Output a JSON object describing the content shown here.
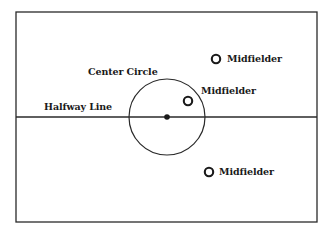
{
  "diagram": {
    "colors": {
      "line": "#2a2a2a",
      "background": "#ffffff",
      "text": "#1a1a1a"
    },
    "field": {
      "x": 16,
      "y": 12,
      "width": 301,
      "height": 210
    },
    "halfway_line": {
      "y": 117,
      "label": "Halfway Line",
      "label_x": 44,
      "label_y": 102
    },
    "center_circle": {
      "cx": 167,
      "cy": 117,
      "r": 38,
      "label": "Center Circle",
      "label_x": 88,
      "label_y": 67
    },
    "center_spot": {
      "cx": 167,
      "cy": 117,
      "r": 2.8
    },
    "players": [
      {
        "role": "Midfielder",
        "label": "Midfielder",
        "cx": 216,
        "cy": 59,
        "label_x": 227,
        "label_y": 54
      },
      {
        "role": "Midfielder",
        "label": "Midfielder",
        "cx": 188,
        "cy": 101,
        "label_x": 201,
        "label_y": 86
      },
      {
        "role": "Midfielder",
        "label": "Midfielder",
        "cx": 209,
        "cy": 172,
        "label_x": 219,
        "label_y": 167
      }
    ]
  }
}
